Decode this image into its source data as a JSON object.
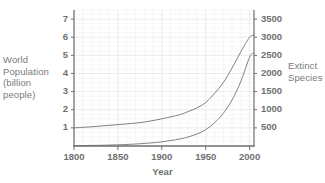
{
  "chart_data": {
    "type": "line",
    "title": "",
    "xlabel": "Year",
    "x": [
      1800,
      1850,
      1900,
      1950,
      2000
    ],
    "xlim": [
      1800,
      2005
    ],
    "xticks": [
      "1800",
      "1850",
      "1900",
      "1950",
      "2000"
    ],
    "grid": true,
    "legend": "none",
    "axes": [
      {
        "id": "left",
        "label": "World Population (billion people)",
        "label_lines": [
          "World",
          "Population",
          "(billion",
          "people)"
        ],
        "ylim": [
          0,
          7.5
        ],
        "yticks": [
          "1",
          "2",
          "3",
          "4",
          "5",
          "6",
          "7"
        ],
        "ytick_values": [
          1,
          2,
          3,
          4,
          5,
          6,
          7
        ],
        "units": "billion people"
      },
      {
        "id": "right",
        "label": "Extinct Species",
        "label_lines": [
          "Extinct",
          "Species"
        ],
        "ylim": [
          0,
          3750
        ],
        "yticks": [
          "500",
          "1000",
          "1500",
          "2000",
          "2500",
          "3000",
          "3500"
        ],
        "ytick_values": [
          500,
          1000,
          1500,
          2000,
          2500,
          3000,
          3500
        ],
        "units": "species"
      }
    ],
    "series": [
      {
        "name": "World Population",
        "axis": "left",
        "color": "#808080",
        "x": [
          1800,
          1820,
          1840,
          1860,
          1880,
          1900,
          1920,
          1930,
          1940,
          1950,
          1960,
          1970,
          1980,
          1990,
          2000,
          2005
        ],
        "values": [
          1.0,
          1.06,
          1.14,
          1.22,
          1.32,
          1.5,
          1.72,
          1.9,
          2.1,
          2.4,
          2.9,
          3.5,
          4.3,
          5.2,
          6.0,
          6.1
        ]
      },
      {
        "name": "Extinct Species",
        "axis": "right",
        "color": "#808080",
        "x": [
          1800,
          1840,
          1870,
          1890,
          1900,
          1920,
          1930,
          1940,
          1950,
          1960,
          1970,
          1980,
          1990,
          2000,
          2005
        ],
        "values": [
          10,
          25,
          55,
          90,
          115,
          190,
          250,
          330,
          450,
          640,
          900,
          1270,
          1780,
          2450,
          2560
        ]
      }
    ]
  },
  "labels": {
    "y_left_title": "World\nPopulation\n(billion\npeople)",
    "y_right_title": "Extinct\nSpecies",
    "x_title": "Year"
  },
  "colors": {
    "axis": "#6f6f6f",
    "grid": "#e2e2e8",
    "curve": "#808080",
    "text": "#6f6f6f"
  }
}
